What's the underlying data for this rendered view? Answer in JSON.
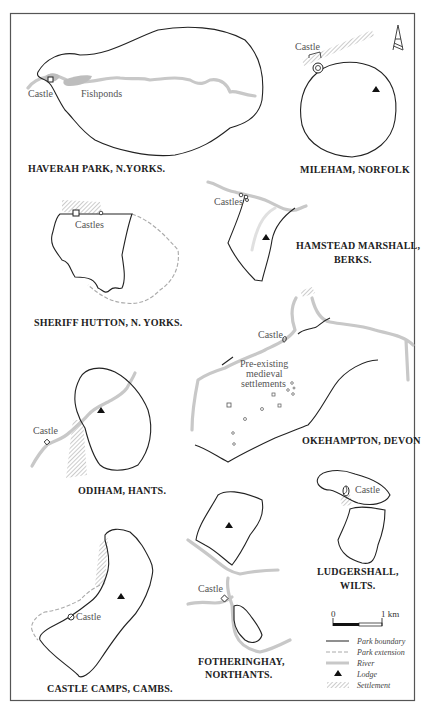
{
  "figure": {
    "frame": {
      "x": 10,
      "y": 13,
      "width": 404,
      "height": 687,
      "border_color": "#555555"
    },
    "north_arrow": {
      "label": "north-arrow",
      "x": 398,
      "y": 25
    },
    "panels": [
      {
        "id": "haverah",
        "title": "HAVERAH PARK, N.YORKS.",
        "labels": [
          "Castle",
          "Fishponds"
        ]
      },
      {
        "id": "mileham",
        "title": "MILEHAM, NORFOLK",
        "labels": [
          "Castle"
        ]
      },
      {
        "id": "sheriff",
        "title": "SHERIFF HUTTON, N. YORKS.",
        "labels": [
          "Castles"
        ]
      },
      {
        "id": "hamstead",
        "title_line1": "HAMSTEAD MARSHALL,",
        "title_line2": "BERKS.",
        "labels": [
          "Castles"
        ]
      },
      {
        "id": "okehampton",
        "title": "OKEHAMPTON, DEVON",
        "labels": [
          "Castle",
          "Pre-existing",
          "medieval",
          "settlements"
        ]
      },
      {
        "id": "odiham",
        "title": "ODIHAM, HANTS.",
        "labels": [
          "Castle"
        ]
      },
      {
        "id": "ludgershall",
        "title_line1": "LUDGERSHALL,",
        "title_line2": "WILTS.",
        "labels": [
          "Castle"
        ]
      },
      {
        "id": "castlecamps",
        "title": "CASTLE CAMPS, CAMBS.",
        "labels": [
          "Castle"
        ]
      },
      {
        "id": "fotheringhay",
        "title_line1": "FOTHERINGHAY,",
        "title_line2": "NORTHANTS.",
        "labels": [
          "Castle"
        ]
      }
    ],
    "scale_bar": {
      "start_label": "0",
      "end_label": "1 km"
    },
    "legend": [
      {
        "symbol": "solid-line",
        "label": "Park boundary"
      },
      {
        "symbol": "dashed-line",
        "label": "Park extension"
      },
      {
        "symbol": "grey-thick-line",
        "label": "River"
      },
      {
        "symbol": "triangle",
        "label": "Lodge"
      },
      {
        "symbol": "hatch",
        "label": "Settlement"
      }
    ],
    "colors": {
      "park_boundary": "#222222",
      "park_extension": "#aaaaaa",
      "river": "#c8c8c8",
      "fishponds": "#bdbdbd",
      "hatch": "#999999"
    }
  }
}
